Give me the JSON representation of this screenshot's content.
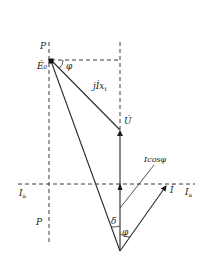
{
  "diagram": {
    "colors": {
      "line": "#2a2a2a",
      "dash": "#3a3a3a",
      "text": "#1a1a1a",
      "background": "#ffffff"
    },
    "points": {
      "origin": [
        120,
        251
      ],
      "E0": [
        51,
        61
      ],
      "U": [
        120,
        130
      ],
      "I_tip": [
        167,
        185
      ],
      "Icos_tip": [
        120,
        184
      ],
      "icos_leader_start": [
        120,
        208
      ],
      "icos_leader_end": [
        154,
        165
      ]
    },
    "labels": {
      "p_top": "P",
      "e0": "Ė₀",
      "phi_top": "φ",
      "jixt": "jİx",
      "jixt_sub": "t",
      "u": "U̇",
      "icosphi": "Icosφ",
      "ia_left": "I",
      "ia_left_sub": "a",
      "ia_right": "I",
      "ia_right_sub": "a",
      "i": "İ",
      "p_bottom": "P",
      "delta": "δ",
      "phi_bottom": "φ"
    },
    "elements": [
      {
        "name": "E0 phasor",
        "from": "origin",
        "to": "E0",
        "style": "solid"
      },
      {
        "name": "U phasor",
        "from": "origin",
        "to": "U",
        "style": "solid",
        "arrow": true
      },
      {
        "name": "jIxt phasor",
        "from": "U",
        "to": "E0",
        "style": "solid"
      },
      {
        "name": "I phasor",
        "from": "origin",
        "to": "I_tip",
        "style": "solid",
        "arrow": true
      },
      {
        "name": "Icos phi component",
        "from": "origin",
        "to": "Icos_tip",
        "style": "solid",
        "arrow": true
      },
      {
        "name": "P-P line",
        "style": "dashed",
        "vertical": true
      },
      {
        "name": "Ia-Ia line",
        "style": "dashed",
        "horizontal": true
      },
      {
        "name": "U extension line",
        "style": "dashed",
        "vertical": true
      },
      {
        "name": "E0 horizontal projection",
        "style": "dashed",
        "horizontal": true
      }
    ]
  }
}
